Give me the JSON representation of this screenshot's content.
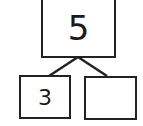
{
  "number_bond": {
    "whole": "5",
    "parts": [
      {
        "value": "3"
      },
      {
        "value": ""
      }
    ]
  },
  "colors": {
    "stroke": "#222222",
    "text": "#1a1a1a",
    "background": "#ffffff"
  }
}
